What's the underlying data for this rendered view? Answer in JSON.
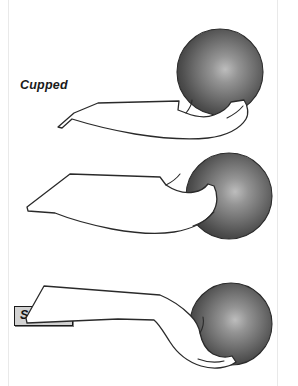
{
  "page": {
    "width": 298,
    "height": 386,
    "background": "#ffffff",
    "ink_color": "#1a1a1a"
  },
  "figures": [
    {
      "id": "cupped",
      "label": "Cupped",
      "label_style": "bold-italic",
      "highlighted": false,
      "ball": {
        "cx": 220,
        "cy": 72,
        "r": 43
      },
      "icon": "hand-holding-ball-cupped"
    },
    {
      "id": "straight",
      "label": "Straight",
      "label_style": "bold-italic-boxed",
      "highlighted": true,
      "highlight_fill": "#d2d2d2",
      "highlight_border": "#1a1a1a",
      "ball": {
        "cx": 229,
        "cy": 196,
        "r": 43
      },
      "icon": "hand-holding-ball-straight"
    },
    {
      "id": "broken-wrist",
      "label": "Broken  Wrist",
      "label_style": "bold-italic",
      "highlighted": false,
      "ball": {
        "cx": 231,
        "cy": 324,
        "r": 41
      },
      "icon": "hand-holding-ball-broken-wrist"
    }
  ],
  "ball": {
    "name": "bowling-ball",
    "shading": "radial-gradient",
    "highlight_color": "#b8b8b8",
    "mid_color": "#6e6e6e",
    "edge_color": "#3a3a3a",
    "outline_color": "#2a2a2a"
  },
  "scan_edges": {
    "left_x": 8,
    "right_x": 277,
    "color": "#e9e9e9"
  }
}
